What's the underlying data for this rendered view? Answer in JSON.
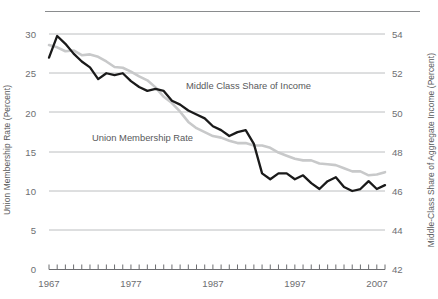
{
  "figure": {
    "background_color": "#ffffff",
    "top_rule_color": "#8a8c8e"
  },
  "left_axis": {
    "title": "Union Membership Rate (Percent)",
    "ticks": [
      "0",
      "5",
      "10",
      "15",
      "20",
      "25",
      "30"
    ],
    "min": 0,
    "max": 30
  },
  "right_axis": {
    "title": "Middle-Class Share of Aggregate Income (Percent)",
    "ticks": [
      "42",
      "44",
      "46",
      "48",
      "50",
      "52",
      "54"
    ],
    "min": 42,
    "max": 54
  },
  "x_axis": {
    "ticks": [
      "1967",
      "1977",
      "1987",
      "1997",
      "2007"
    ],
    "min": 1967,
    "max": 2008,
    "tick_interval": 1
  },
  "series_labels": {
    "middle_class": "Middle Class Share of Income",
    "union": "Union Membership Rate"
  },
  "colors": {
    "union_line": "#c8c9ca",
    "middle_class_line": "#1a1a1a",
    "gridline": "#bcbec0",
    "text": "#58595b"
  },
  "chart_data": {
    "type": "line",
    "title": "",
    "xlabel": "",
    "ylabel": "Union Membership Rate (Percent)",
    "y2label": "Middle-Class Share of Aggregate Income (Percent)",
    "xlim": [
      1967,
      2008
    ],
    "ylim": [
      0,
      30
    ],
    "y2lim": [
      42,
      54
    ],
    "grid": true,
    "legend": "inline-annotations",
    "x": [
      1967,
      1968,
      1969,
      1970,
      1971,
      1972,
      1973,
      1974,
      1975,
      1976,
      1977,
      1978,
      1979,
      1980,
      1981,
      1982,
      1983,
      1984,
      1985,
      1986,
      1987,
      1988,
      1989,
      1990,
      1991,
      1992,
      1993,
      1994,
      1995,
      1996,
      1997,
      1998,
      1999,
      2000,
      2001,
      2002,
      2003,
      2004,
      2005,
      2006,
      2007,
      2008
    ],
    "series": [
      {
        "name": "Middle Class Share of Income",
        "axis": "right",
        "color": "#1a1a1a",
        "units": "percent",
        "values": [
          52.8,
          53.9,
          53.5,
          53.0,
          52.6,
          52.3,
          51.7,
          52.0,
          51.9,
          52.0,
          51.6,
          51.3,
          51.1,
          51.2,
          51.1,
          50.6,
          50.4,
          50.1,
          49.9,
          49.7,
          49.3,
          49.1,
          48.8,
          49.0,
          49.1,
          48.4,
          46.9,
          46.6,
          46.9,
          46.9,
          46.6,
          46.8,
          46.4,
          46.1,
          46.5,
          46.7,
          46.2,
          46.0,
          46.1,
          46.5,
          46.1,
          46.3
        ]
      },
      {
        "name": "Union Membership Rate",
        "axis": "left",
        "color": "#c8c9ca",
        "units": "percent",
        "values": [
          28.6,
          28.3,
          27.8,
          27.9,
          27.3,
          27.4,
          27.1,
          26.5,
          25.8,
          25.7,
          25.2,
          24.6,
          24.1,
          23.2,
          22.0,
          21.2,
          20.1,
          18.8,
          18.0,
          17.5,
          17.0,
          16.8,
          16.4,
          16.1,
          16.1,
          15.8,
          15.8,
          15.5,
          14.9,
          14.5,
          14.1,
          13.9,
          13.9,
          13.5,
          13.4,
          13.3,
          12.9,
          12.5,
          12.5,
          12.0,
          12.1,
          12.4
        ]
      }
    ],
    "annotations": [
      {
        "text": "Middle Class Share of Income",
        "near_x": 1987,
        "near_y2": 50.3
      },
      {
        "text": "Union Membership Rate",
        "near_x": 1975,
        "near_y": 16.8
      }
    ]
  }
}
